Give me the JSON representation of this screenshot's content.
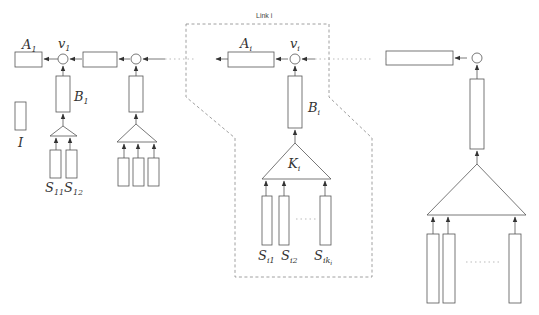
{
  "diagram": {
    "group_title": "Link i",
    "labels": {
      "A1": {
        "base": "A",
        "sub": "1"
      },
      "v1": {
        "base": "v",
        "sub": "1"
      },
      "B1": {
        "base": "B",
        "sub": "1"
      },
      "I": {
        "base": "I",
        "sub": ""
      },
      "S11": {
        "base": "S",
        "sub": "11"
      },
      "S12": {
        "base": "S",
        "sub": "12"
      },
      "Ai": {
        "base": "A",
        "sub": "i"
      },
      "vi": {
        "base": "v",
        "sub": "i"
      },
      "Bi": {
        "base": "B",
        "sub": "i"
      },
      "Ki": {
        "base": "K",
        "sub": "i"
      },
      "Si1": {
        "base": "S",
        "sub": "i1"
      },
      "Si2": {
        "base": "S",
        "sub": "i2"
      },
      "Siki": {
        "base": "S",
        "sub": "ik",
        "subsub": "i"
      }
    },
    "stroke_color": "#555555",
    "dashed_border_color": "#888888"
  }
}
